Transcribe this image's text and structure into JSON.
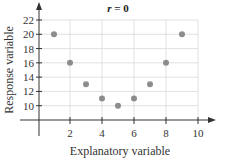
{
  "chart_data": {
    "type": "scatter",
    "title": "r = 0",
    "title_parts": {
      "var": "r",
      "rest": " = 0"
    },
    "xlabel": "Explanatory variable",
    "ylabel": "Response variable",
    "xlim": [
      0,
      10
    ],
    "ylim": [
      8,
      22
    ],
    "xticks": [
      2,
      4,
      6,
      8,
      10
    ],
    "yticks": [
      10,
      12,
      14,
      16,
      18,
      20,
      22
    ],
    "grid": true,
    "points": [
      {
        "x": 1,
        "y": 20
      },
      {
        "x": 2,
        "y": 16
      },
      {
        "x": 3,
        "y": 13
      },
      {
        "x": 4,
        "y": 11
      },
      {
        "x": 5,
        "y": 10
      },
      {
        "x": 6,
        "y": 11
      },
      {
        "x": 7,
        "y": 13
      },
      {
        "x": 8,
        "y": 16
      },
      {
        "x": 9,
        "y": 20
      }
    ],
    "colors": {
      "point": "#8c8c8c",
      "grid": "#d9d9d9",
      "axis": "#333333"
    }
  }
}
